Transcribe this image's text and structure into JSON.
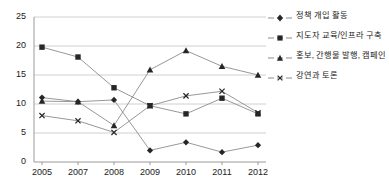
{
  "chart_data": {
    "type": "line",
    "title": "",
    "subtitle": "",
    "xlabel": "",
    "ylabel": "",
    "categories": [
      "2005",
      "2007",
      "2008",
      "2009",
      "2010",
      "2011",
      "2012"
    ],
    "ylim": [
      0,
      25
    ],
    "yticks": [
      0,
      5,
      10,
      15,
      20,
      25
    ],
    "grid": true,
    "legend_position": "right",
    "series": [
      {
        "name": "정책 개입 활동",
        "marker": "diamond",
        "color": "#262626",
        "values": [
          11.1,
          10.4,
          10.7,
          2.0,
          3.4,
          1.7,
          2.9
        ]
      },
      {
        "name": "지도자 교육/인프라 구축",
        "marker": "square",
        "color": "#262626",
        "values": [
          19.8,
          18.1,
          12.8,
          9.7,
          8.3,
          11.0,
          8.3
        ]
      },
      {
        "name": "홍보, 간행물 발행, 캠페인",
        "marker": "triangle",
        "color": "#262626",
        "values": [
          10.5,
          10.4,
          6.3,
          15.9,
          19.2,
          16.5,
          15.0
        ]
      },
      {
        "name": "강연과 토론",
        "marker": "x",
        "color": "#262626",
        "values": [
          8.0,
          7.1,
          5.1,
          9.7,
          11.4,
          12.2,
          8.5
        ]
      }
    ]
  },
  "axes": {
    "y_tick_labels": [
      "25",
      "20",
      "15",
      "10",
      "5",
      "0"
    ],
    "x_tick_labels": [
      "2005",
      "2007",
      "2008",
      "2009",
      "2010",
      "2011",
      "2012"
    ]
  },
  "legend": {
    "items": [
      {
        "label": "정책 개입 활동"
      },
      {
        "label": "지도자 교육/인프라 구축"
      },
      {
        "label": "홍보, 간행물 발행, 캠페인"
      },
      {
        "label": "강연과 토론"
      }
    ]
  },
  "style": {
    "line_color": "#8c8c8c",
    "marker_color": "#262626",
    "grid_color": "#d0d0d0",
    "axis_color": "#9a9a9a",
    "background": "#ffffff"
  }
}
